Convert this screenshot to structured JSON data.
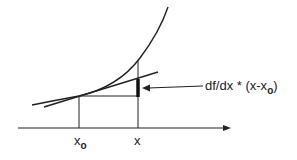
{
  "diagram": {
    "type": "tangent-line-approximation",
    "annotation": {
      "main": "df/dx * (x-x",
      "sub": "o",
      "close": ")"
    },
    "axis_labels": {
      "x0_main": "x",
      "x0_sub": "o",
      "x": "x"
    },
    "colors": {
      "stroke": "#222222",
      "background": "#ffffff"
    }
  }
}
